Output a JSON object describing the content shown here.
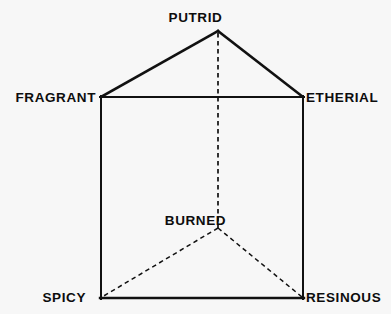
{
  "figure": {
    "kind": "odor-prism-diagram",
    "background_color": "#f7f7f7",
    "stroke_color": "#111111",
    "text_color": "#0d0d0d",
    "width": 391,
    "height": 314
  },
  "labels": {
    "putrid": "PUTRID",
    "fragrant": "FRAGRANT",
    "etherial": "ETHERIAL",
    "burned": "BURNED",
    "spicy": "SPICY",
    "resinous": "RESINOUS"
  },
  "vertices": [
    {
      "name": "putrid",
      "label": "PUTRID",
      "x": 218,
      "y": 31,
      "hidden": false
    },
    {
      "name": "fragrant",
      "label": "FRAGRANT",
      "x": 101,
      "y": 97,
      "hidden": false
    },
    {
      "name": "etherial",
      "label": "ETHERIAL",
      "x": 303,
      "y": 97,
      "hidden": false
    },
    {
      "name": "burned",
      "label": "BURNED",
      "x": 218,
      "y": 228,
      "hidden": true
    },
    {
      "name": "spicy",
      "label": "SPICY",
      "x": 101,
      "y": 298,
      "hidden": false
    },
    {
      "name": "resinous",
      "label": "RESINOUS",
      "x": 303,
      "y": 298,
      "hidden": false
    }
  ],
  "edges": [
    {
      "name": "fragrant-putrid",
      "from": "fragrant",
      "to": "putrid",
      "style": "solid",
      "width": 2.6
    },
    {
      "name": "putrid-etherial",
      "from": "putrid",
      "to": "etherial",
      "style": "solid",
      "width": 2.6
    },
    {
      "name": "fragrant-etherial",
      "from": "fragrant",
      "to": "etherial",
      "style": "solid",
      "width": 2.0
    },
    {
      "name": "fragrant-spicy",
      "from": "fragrant",
      "to": "spicy",
      "style": "solid",
      "width": 2.0
    },
    {
      "name": "etherial-resinous",
      "from": "etherial",
      "to": "resinous",
      "style": "solid",
      "width": 2.0
    },
    {
      "name": "spicy-resinous",
      "from": "spicy",
      "to": "resinous",
      "style": "solid",
      "width": 2.4
    },
    {
      "name": "putrid-burned",
      "from": "putrid",
      "to": "burned",
      "style": "dashed",
      "width": 1.7
    },
    {
      "name": "burned-spicy",
      "from": "burned",
      "to": "spicy",
      "style": "dashed",
      "width": 1.5
    },
    {
      "name": "burned-resinous",
      "from": "burned",
      "to": "resinous",
      "style": "dashed",
      "width": 1.5
    }
  ]
}
